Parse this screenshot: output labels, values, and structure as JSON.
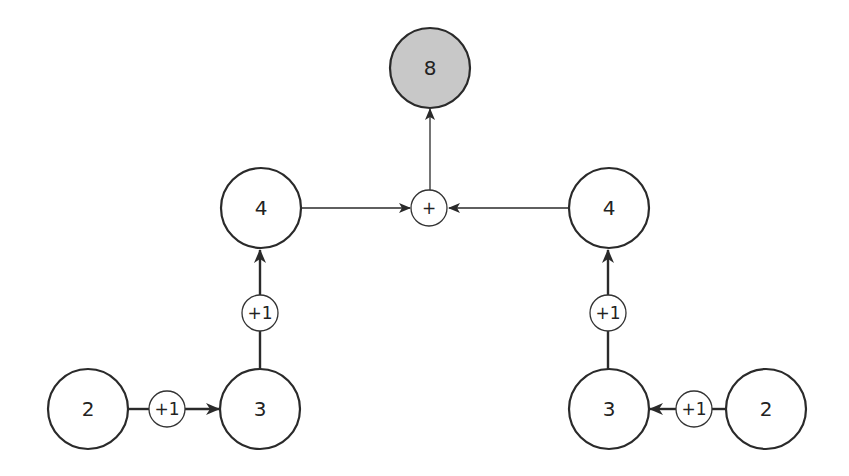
{
  "diagram": {
    "nodes": [
      {
        "id": "n8",
        "label": "8",
        "kind": "result"
      },
      {
        "id": "plus",
        "label": "+",
        "kind": "op"
      },
      {
        "id": "l4",
        "label": "4",
        "kind": "value"
      },
      {
        "id": "r4",
        "label": "4",
        "kind": "value"
      },
      {
        "id": "lv1",
        "label": "+1",
        "kind": "op"
      },
      {
        "id": "rv1",
        "label": "+1",
        "kind": "op"
      },
      {
        "id": "l3",
        "label": "3",
        "kind": "value"
      },
      {
        "id": "r3",
        "label": "3",
        "kind": "value"
      },
      {
        "id": "lh1",
        "label": "+1",
        "kind": "op"
      },
      {
        "id": "rh1",
        "label": "+1",
        "kind": "op"
      },
      {
        "id": "l2",
        "label": "2",
        "kind": "value"
      },
      {
        "id": "r2",
        "label": "2",
        "kind": "value"
      }
    ],
    "edges": [
      {
        "from": "l2",
        "via": "lh1",
        "to": "l3"
      },
      {
        "from": "l3",
        "via": "lv1",
        "to": "l4"
      },
      {
        "from": "r2",
        "via": "rh1",
        "to": "r3"
      },
      {
        "from": "r3",
        "via": "rv1",
        "to": "r4"
      },
      {
        "from": "l4",
        "to": "plus"
      },
      {
        "from": "r4",
        "to": "plus"
      },
      {
        "from": "plus",
        "to": "n8"
      }
    ],
    "colors": {
      "result_fill": "#c8c8c8",
      "stroke": "#2a2a2a",
      "background": "#ffffff"
    }
  }
}
